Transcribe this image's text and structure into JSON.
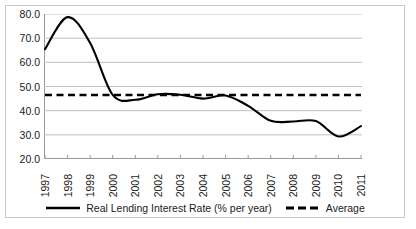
{
  "chart_data": {
    "type": "line",
    "title": "",
    "subtitle": "",
    "xlabel": "",
    "ylabel": "",
    "x": [
      "1997",
      "1998",
      "1999",
      "2000",
      "2001",
      "2002",
      "2003",
      "2004",
      "2005",
      "2006",
      "2007",
      "2008",
      "2009",
      "2010",
      "2011"
    ],
    "xlim": [
      "1997",
      "2011"
    ],
    "ylim": [
      20.0,
      80.0
    ],
    "yticks": [
      "20.0",
      "30.0",
      "40.0",
      "50.0",
      "60.0",
      "70.0",
      "80.0"
    ],
    "ytick_values": [
      20.0,
      30.0,
      40.0,
      50.0,
      60.0,
      70.0,
      80.0
    ],
    "grid": "horizontal",
    "legend_position": "bottom-center",
    "series": [
      {
        "name": "Real Lending Interest Rate (% per year)",
        "style": "solid",
        "color": "#000000",
        "values": [
          65.5,
          78.7,
          68.0,
          46.5,
          44.5,
          46.8,
          46.6,
          45.0,
          46.3,
          42.0,
          35.8,
          35.5,
          35.7,
          29.3,
          33.6
        ]
      },
      {
        "name": "Average",
        "style": "dashed",
        "color": "#000000",
        "values": [
          46.5,
          46.5,
          46.5,
          46.5,
          46.5,
          46.5,
          46.5,
          46.5,
          46.5,
          46.5,
          46.5,
          46.5,
          46.5,
          46.5,
          46.5
        ]
      }
    ],
    "colors": {
      "series_line": "#000000",
      "average_line": "#000000",
      "gridline": "#c0c0c0",
      "axis": "#9a9a9a",
      "frame": "#c8c8c8",
      "background": "#ffffff",
      "text": "#1a1a1a"
    }
  },
  "legend": {
    "items": [
      {
        "label": "Real Lending Interest Rate (% per year)",
        "icon": "solid-line-swatch"
      },
      {
        "label": "Average",
        "icon": "dashed-line-swatch"
      }
    ]
  }
}
